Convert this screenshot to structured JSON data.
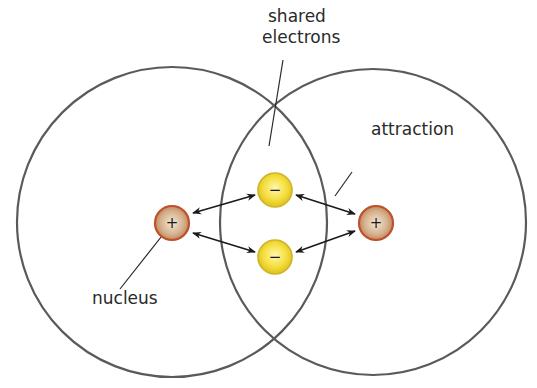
{
  "diagram": {
    "labels": {
      "shared_line1": "shared",
      "shared_line2": "electrons",
      "attraction": "attraction",
      "nucleus": "nucleus"
    },
    "signs": {
      "nucleus_left": "+",
      "nucleus_right": "+",
      "electron_top": "−",
      "electron_bottom": "−"
    },
    "atoms": [
      {
        "name": "left-atom",
        "center": [
          172,
          222
        ],
        "radius": 155
      },
      {
        "name": "right-atom",
        "center": [
          373,
          222
        ],
        "radius": 153
      }
    ],
    "particles": {
      "nuclei": [
        {
          "name": "left-nucleus",
          "center": [
            172,
            223
          ],
          "charge": "+"
        },
        {
          "name": "right-nucleus",
          "center": [
            376,
            223
          ],
          "charge": "+"
        }
      ],
      "electrons": [
        {
          "name": "shared-electron-top",
          "center": [
            275,
            190
          ],
          "charge": "−"
        },
        {
          "name": "shared-electron-bottom",
          "center": [
            275,
            257
          ],
          "charge": "−"
        }
      ]
    },
    "colors": {
      "atom_outline": "#5a5a5a",
      "nucleus_fill": "#d8b898",
      "nucleus_stroke": "#c0502a",
      "electron_fill": "#f3dc3c",
      "electron_stroke": "#c8b020",
      "arrow": "#1a1a1a"
    }
  }
}
